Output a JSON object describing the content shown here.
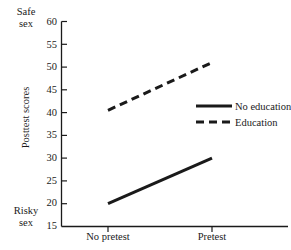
{
  "chart_data": {
    "type": "line",
    "title": "",
    "xlabel": "",
    "ylabel": "Posttest scores",
    "categories": [
      "No pretest",
      "Pretest"
    ],
    "x": [
      0,
      1
    ],
    "ylim": [
      15,
      60
    ],
    "yticks": [
      15,
      20,
      25,
      30,
      35,
      40,
      45,
      50,
      55,
      60
    ],
    "ytick_labels": [
      "15",
      "20",
      "25",
      "30",
      "35",
      "40",
      "45",
      "50",
      "55",
      "60"
    ],
    "grid": false,
    "legend_position": "center-right",
    "axis_high_label": "Safe\nsex",
    "axis_low_label": "Risky\nsex",
    "series": [
      {
        "name": "No education",
        "style": "solid",
        "color": "#1a1a1a",
        "values": [
          20,
          30
        ]
      },
      {
        "name": "Education",
        "style": "dashed",
        "color": "#1a1a1a",
        "values": [
          40.5,
          51
        ]
      }
    ]
  },
  "axis": {
    "high_anchor": "Safe\nsex",
    "low_anchor": "Risky\nsex",
    "y_title": "Posttest scores",
    "ticks": [
      {
        "value": "60"
      },
      {
        "value": "55"
      },
      {
        "value": "50"
      },
      {
        "value": "45"
      },
      {
        "value": "40"
      },
      {
        "value": "35"
      },
      {
        "value": "30"
      },
      {
        "value": "25"
      },
      {
        "value": "20"
      },
      {
        "value": "15"
      }
    ],
    "categories": [
      {
        "label": "No pretest"
      },
      {
        "label": "Pretest"
      }
    ]
  },
  "legend": {
    "entries": [
      {
        "label": "No education",
        "style": "solid"
      },
      {
        "label": "Education",
        "style": "dashed"
      }
    ]
  }
}
